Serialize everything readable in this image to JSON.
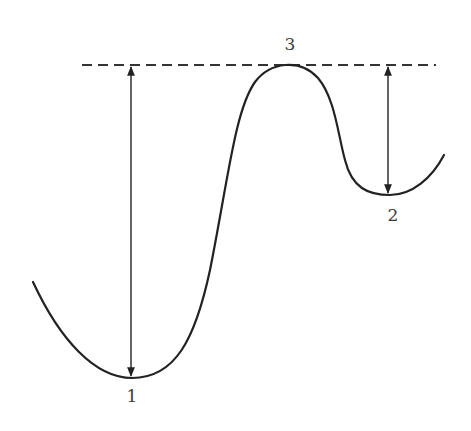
{
  "diagram": {
    "type": "potential-energy-curve",
    "reference_line": {
      "style": "dashed",
      "color": "#333333"
    },
    "curve_color": "#222222",
    "points": [
      {
        "id": "1",
        "label": "1",
        "kind": "global-minimum"
      },
      {
        "id": "2",
        "label": "2",
        "kind": "local-minimum"
      },
      {
        "id": "3",
        "label": "3",
        "kind": "maximum"
      }
    ],
    "arrows": [
      {
        "from": "1",
        "to": "reference-line",
        "style": "double-headed"
      },
      {
        "from": "2",
        "to": "reference-line",
        "style": "double-headed"
      }
    ]
  }
}
